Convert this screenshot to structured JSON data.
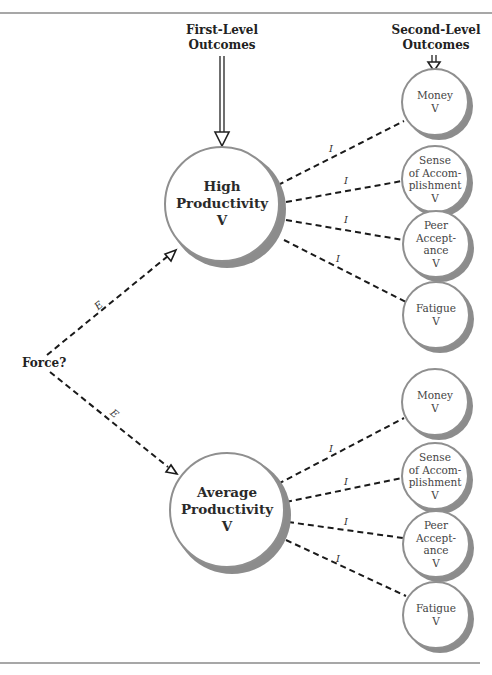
{
  "headers": {
    "first_level": [
      "First-Level",
      "Outcomes"
    ],
    "second_level": [
      "Second-Level",
      "Outcomes"
    ]
  },
  "source": {
    "label": "Force?"
  },
  "links": {
    "expectancy_label": "E",
    "instrumentality_label": "I"
  },
  "first_level_outcomes": [
    {
      "lines": [
        "High",
        "Productivity",
        "V"
      ]
    },
    {
      "lines": [
        "Average",
        "Productivity",
        "V"
      ]
    }
  ],
  "second_level_groups": [
    {
      "parent": "High Productivity",
      "outcomes": [
        {
          "lines": [
            "Money",
            "V"
          ]
        },
        {
          "lines": [
            "Sense",
            "of Accom-",
            "plishment",
            "V"
          ]
        },
        {
          "lines": [
            "Peer",
            "Accept-",
            "ance",
            "V"
          ]
        },
        {
          "lines": [
            "Fatigue",
            "V"
          ]
        }
      ]
    },
    {
      "parent": "Average Productivity",
      "outcomes": [
        {
          "lines": [
            "Money",
            "V"
          ]
        },
        {
          "lines": [
            "Sense",
            "of Accom-",
            "plishment",
            "V"
          ]
        },
        {
          "lines": [
            "Peer",
            "Accept-",
            "ance",
            "V"
          ]
        },
        {
          "lines": [
            "Fatigue",
            "V"
          ]
        }
      ]
    }
  ],
  "colors": {
    "rule": "#8a8a8a",
    "circle_stroke": "#8f8f8f",
    "shadow": "#8c8c8c",
    "line": "#1a1a1a"
  }
}
